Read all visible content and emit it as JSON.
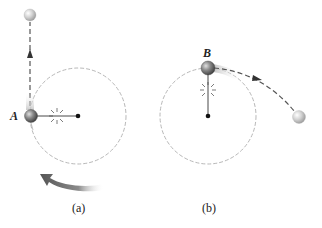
{
  "panels": [
    {
      "id": "a",
      "caption": "(a)",
      "ball_label": "A",
      "description": "Ball on string moving in circle; string breaks at A, ball moves straight up along tangent"
    },
    {
      "id": "b",
      "caption": "(b)",
      "ball_label": "B",
      "description": "String breaks at B, ball follows curved trajectory away from circle"
    }
  ],
  "icons": {
    "snap": "break-starburst-icon",
    "rotation": "counterclockwise-arrow-icon"
  },
  "colors": {
    "circle": "#b8b8b8",
    "dashed_path": "#555555",
    "ball_dark": "#6a6a6a",
    "ball_light": "#d8d8d8",
    "rotation_arrow": "#6e6e6e",
    "text": "#222222"
  }
}
